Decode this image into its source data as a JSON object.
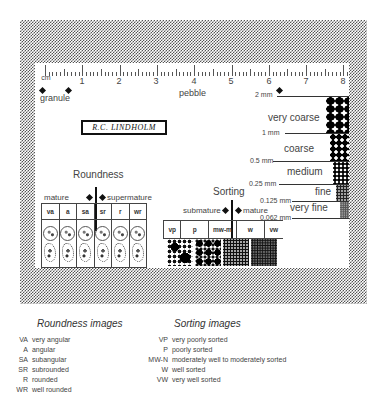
{
  "card": {
    "signature": "R.C. LINDHOLM",
    "ruler": {
      "unit": "cm",
      "numbers": [
        "1",
        "2",
        "3",
        "4",
        "5",
        "6",
        "7",
        "8"
      ],
      "granule_label": "granule",
      "pebble_label": "pebble"
    },
    "roundness": {
      "title": "Roundness",
      "left_label": "mature",
      "right_label": "supermature",
      "columns": [
        "va",
        "a",
        "sa",
        "sr",
        "r",
        "wr"
      ]
    },
    "sorting": {
      "title": "Sorting",
      "left_label": "submature",
      "right_label": "mature",
      "columns": [
        "vp",
        "p",
        "mw-m",
        "w",
        "vw"
      ]
    },
    "grain_scale": {
      "boundaries": [
        "2 mm",
        "1 mm",
        "0.5 mm",
        "0.25 mm",
        "0.125 mm",
        "0.062 mm"
      ],
      "classes": [
        "very coarse",
        "coarse",
        "medium",
        "fine",
        "very fine"
      ]
    }
  },
  "legend": {
    "roundness": {
      "title": "Roundness images",
      "items": [
        {
          "code": "VA",
          "label": "very angular"
        },
        {
          "code": "A",
          "label": "angular"
        },
        {
          "code": "SA",
          "label": "subangular"
        },
        {
          "code": "SR",
          "label": "subrounded"
        },
        {
          "code": "R",
          "label": "rounded"
        },
        {
          "code": "WR",
          "label": "well rounded"
        }
      ]
    },
    "sorting": {
      "title": "Sorting images",
      "items": [
        {
          "code": "VP",
          "label": "very poorly sorted"
        },
        {
          "code": "P",
          "label": "poorly sorted"
        },
        {
          "code": "MW-N",
          "label": "moderately well to moderately sorted"
        },
        {
          "code": "W",
          "label": "well sorted"
        },
        {
          "code": "VW",
          "label": "very well sorted"
        }
      ]
    }
  }
}
